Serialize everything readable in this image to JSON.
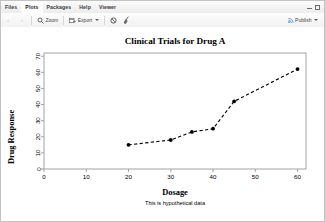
{
  "pane": {
    "tabs": [
      {
        "label": "Files",
        "active": false
      },
      {
        "label": "Plots",
        "active": true
      },
      {
        "label": "Packages",
        "active": false
      },
      {
        "label": "Help",
        "active": false
      },
      {
        "label": "Viewer",
        "active": false
      }
    ],
    "window_controls": [
      "minimize",
      "maximize"
    ]
  },
  "toolbar": {
    "back_icon": "chevron-left-icon",
    "forward_icon": "chevron-right-icon",
    "zoom_label": "Zoom",
    "zoom_icon": "magnifier-icon",
    "export_label": "Export",
    "export_icon": "export-icon",
    "remove_plot_icon": "clear-plot-icon",
    "clear_all_icon": "broom-icon",
    "publish_label": "Publish",
    "publish_icon": "publish-icon"
  },
  "chart_data": {
    "type": "line",
    "title": "Clinical Trials for Drug A",
    "xlabel": "Dosage",
    "ylabel": "Drug Response",
    "subtitle": "This is hypothetical data",
    "x": [
      20,
      30,
      35,
      40,
      45,
      60
    ],
    "y": [
      15,
      18,
      23,
      25,
      42,
      62
    ],
    "xlim": [
      0,
      62
    ],
    "ylim": [
      0,
      72
    ],
    "xticks": [
      0,
      10,
      20,
      30,
      40,
      50,
      60
    ],
    "yticks": [
      0,
      10,
      20,
      30,
      40,
      50,
      60,
      70
    ],
    "grid": false,
    "legend": "none",
    "line_style": "dashed",
    "line_color": "#000000",
    "marker": "filled-circle",
    "marker_color": "#000000",
    "box": true
  }
}
